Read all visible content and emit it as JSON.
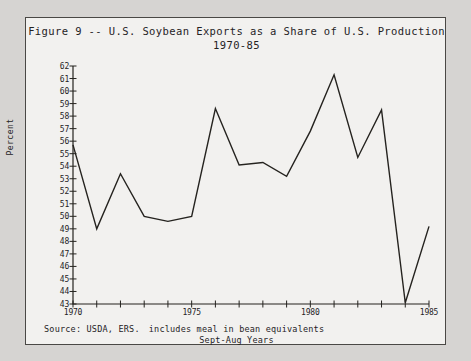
{
  "chart_data": {
    "type": "line",
    "title": "Figure 9 -- U.S. Soybean Exports as a Share of U.S. Production",
    "subtitle": "1970-85",
    "xlabel": "",
    "ylabel": "Percent",
    "xlim": [
      1970,
      1985
    ],
    "ylim": [
      43,
      62
    ],
    "grid": false,
    "legend": null,
    "x": [
      1970,
      1971,
      1972,
      1973,
      1974,
      1975,
      1976,
      1977,
      1978,
      1979,
      1980,
      1981,
      1982,
      1983,
      1984,
      1985
    ],
    "values": [
      55.7,
      49.0,
      53.4,
      50.0,
      49.6,
      50.0,
      58.6,
      54.1,
      54.3,
      53.2,
      56.8,
      61.3,
      54.7,
      58.5,
      43.1,
      49.2
    ],
    "ytick_labels": [
      "43",
      "44",
      "45",
      "46",
      "47",
      "48",
      "49",
      "50",
      "51",
      "52",
      "53",
      "54",
      "55",
      "56",
      "57",
      "58",
      "59",
      "60",
      "61",
      "62"
    ],
    "ytick_values": [
      43,
      44,
      45,
      46,
      47,
      48,
      49,
      50,
      51,
      52,
      53,
      54,
      55,
      56,
      57,
      58,
      59,
      60,
      61,
      62
    ],
    "xtick_values": [
      1970,
      1971,
      1972,
      1973,
      1974,
      1975,
      1976,
      1977,
      1978,
      1979,
      1980,
      1981,
      1982,
      1983,
      1984,
      1985
    ],
    "xtick_labels": [
      {
        "value": 1970,
        "label": "1970"
      },
      {
        "value": 1975,
        "label": "1975"
      },
      {
        "value": 1980,
        "label": "1980"
      },
      {
        "value": 1985,
        "label": "1985"
      }
    ],
    "line_color": "#25231f",
    "background_color": "#f2f1ef"
  },
  "footer": {
    "source": "Source:  USDA, ERS.",
    "note_line_1": "includes meal in bean equivalents",
    "note_line_2": "Sept-Aug Years"
  }
}
